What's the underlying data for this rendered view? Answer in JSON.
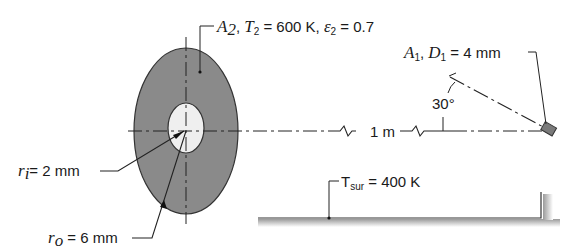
{
  "labels": {
    "disk": {
      "A": "A",
      "A_sub": "2",
      "T": "T",
      "T_sub": "2",
      "T_val": " = 600 K, ",
      "eps": "ε",
      "eps_sub": "2",
      "eps_val": " = 0.7"
    },
    "detector": {
      "A": "A",
      "A_sub": "1",
      "D": "D",
      "D_sub": "1",
      "D_val": " = 4 mm"
    },
    "angle": "30°",
    "distance": "1 m",
    "inner_radius": {
      "r": "r",
      "sub": "i",
      "val": "= 2 mm"
    },
    "outer_radius": {
      "r": "r",
      "sub": "o",
      "val": " = 6 mm"
    },
    "surroundings": {
      "T": "T",
      "sub": "sur",
      "val": " = 400 K"
    }
  },
  "colors": {
    "annulus": "#8a8a8a",
    "hole": "#efefef",
    "line": "#222222",
    "detector": "#7a7a7a"
  }
}
